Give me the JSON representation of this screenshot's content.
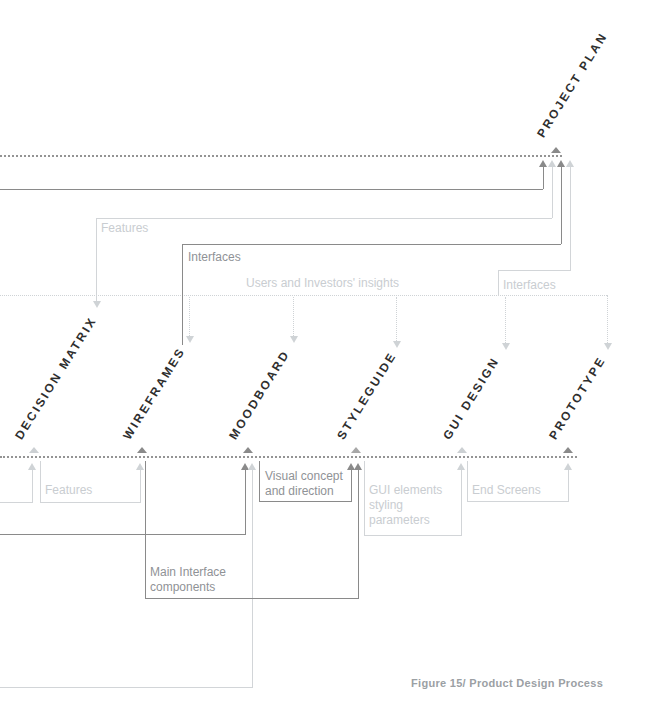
{
  "figure": {
    "caption": "Figure 15/ Product Design Process"
  },
  "nodes": {
    "project_plan": "PROJECT PLAN",
    "decision_matrix": "DECISION MATRIX",
    "wireframes": "WIREFRAMES",
    "moodboard": "MOODBOARD",
    "styleguide": "STYLEGUIDE",
    "gui_design": "GUI DESIGN",
    "prototype": "PROTOTYPE"
  },
  "flows": {
    "features_top": "Features",
    "interfaces_left": "Interfaces",
    "users_insights": "Users and Investors' insights",
    "interfaces_right": "Interfaces",
    "features_bottom": "Features",
    "visual_concept": "Visual concept and direction",
    "gui_elements": "GUI elements styling parameters",
    "end_screens": "End Screens",
    "main_interface": "Main Interface components"
  },
  "edges": [
    {
      "label": "",
      "from": "left-margin",
      "to": "project_plan",
      "tone": "dark"
    },
    {
      "label": "Features",
      "from": "left-mid",
      "to": "project_plan, decision_matrix",
      "tone": "light"
    },
    {
      "label": "Interfaces",
      "from": "wireframes",
      "to": "project_plan",
      "tone": "dark"
    },
    {
      "label": "Interfaces",
      "from": "gui_design",
      "to": "project_plan",
      "tone": "light"
    },
    {
      "label": "Users and Investors' insights",
      "from": "left-margin",
      "to": "wireframes, moodboard, styleguide, gui_design, prototype",
      "tone": "light-dotted"
    },
    {
      "label": "",
      "from": "left-margin",
      "to": "decision_matrix",
      "tone": "light"
    },
    {
      "label": "Features",
      "from": "decision_matrix",
      "to": "wireframes",
      "tone": "light"
    },
    {
      "label": "",
      "from": "left-margin",
      "to": "moodboard",
      "tone": "dark"
    },
    {
      "label": "",
      "from": "left-margin",
      "to": "moodboard",
      "tone": "light"
    },
    {
      "label": "Main Interface components",
      "from": "wireframes",
      "to": "styleguide",
      "tone": "dark"
    },
    {
      "label": "Visual concept and direction",
      "from": "moodboard",
      "to": "styleguide",
      "tone": "dark"
    },
    {
      "label": "GUI elements styling parameters",
      "from": "styleguide",
      "to": "gui_design",
      "tone": "light"
    },
    {
      "label": "End Screens",
      "from": "gui_design",
      "to": "prototype",
      "tone": "light"
    }
  ],
  "colors": {
    "dark_line": "#8a8a8a",
    "light_line": "#d2d5d8",
    "dark_label_text": "#8f9296",
    "light_label_text": "#c9cdd1",
    "node_text": "#2e2e2e",
    "caption_text": "#9ba0a4",
    "background": "#ffffff"
  }
}
